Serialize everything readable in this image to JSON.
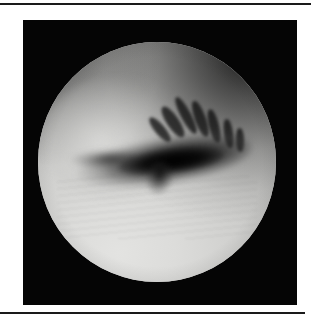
{
  "page": {
    "background_color": "#ffffff",
    "width": 311,
    "height": 324
  },
  "rules": {
    "top": {
      "color": "#1a1a1a",
      "thickness_px": 2
    },
    "bottom": {
      "color": "#1a1a1a",
      "thickness_px": 2
    }
  },
  "figure": {
    "frame": {
      "background_color": "#050505",
      "x": 23,
      "y": 20,
      "width": 274,
      "height": 285
    },
    "scope_view": {
      "shape": "circle",
      "center_x": 156,
      "center_y": 161,
      "radius": 119,
      "modality": "arthroscopy",
      "tone": "grayscale"
    },
    "features": [
      {
        "name": "bright-cartilage-surface",
        "region": "lower-left"
      },
      {
        "name": "dark-fissure-cleft",
        "region": "center"
      },
      {
        "name": "fibrillated-cartilage-edge",
        "region": "upper-right"
      },
      {
        "name": "shadowed-joint-recess",
        "region": "upper-right-rim"
      },
      {
        "name": "tissue-frond-flap",
        "region": "center-below-cleft"
      }
    ],
    "colors": {
      "frame": "#050505",
      "tissue_highlight": "#e3e3e1",
      "tissue_midtone": "#bdbdbb",
      "tissue_shadow": "#7a7a78",
      "fissure": "#000000"
    }
  }
}
